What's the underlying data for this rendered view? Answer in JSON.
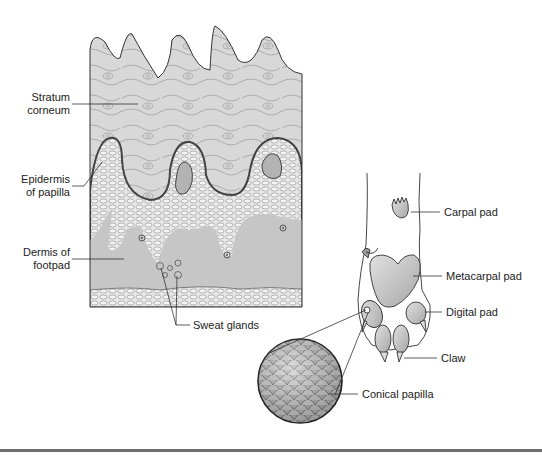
{
  "figure": {
    "type": "anatomical-illustration",
    "colors": {
      "stratum_fill": "#d9d9d9",
      "cell_fill": "#e4e4e4",
      "dermis_fill": "#c6c6c6",
      "outline": "#333333",
      "rule": "#6e6e6e"
    }
  },
  "labels": {
    "stratum_corneum": [
      "Stratum",
      "corneum"
    ],
    "epidermis_of_papilla": [
      "Epidermis",
      "of papilla"
    ],
    "dermis_of_footpad": [
      "Dermis of",
      "footpad"
    ],
    "sweat_glands": "Sweat glands",
    "carpal_pad": "Carpal pad",
    "metacarpal_pad": "Metacarpal pad",
    "digital_pad": "Digital pad",
    "claw": "Claw",
    "conical_papilla": "Conical papilla"
  }
}
